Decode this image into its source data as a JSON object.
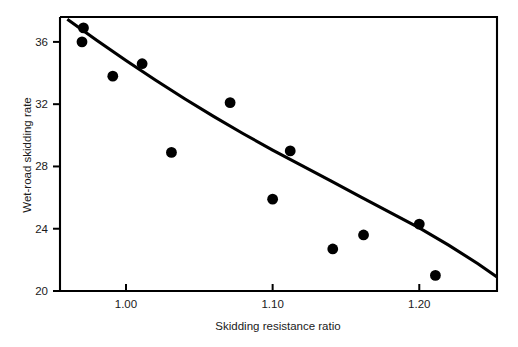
{
  "chart_data": {
    "type": "scatter",
    "title": "",
    "xlabel": "Skidding resistance ratio",
    "ylabel": "Wet-road skidding rate",
    "xlim": [
      0.955,
      1.253
    ],
    "ylim": [
      20,
      37.6
    ],
    "grid": false,
    "legend": null,
    "xticks": [
      "1.00",
      "1.10",
      "1.20"
    ],
    "xtick_values": [
      1.0,
      1.1,
      1.2
    ],
    "yticks": [
      "36",
      "32",
      "28",
      "24",
      "20"
    ],
    "ytick_values": [
      36,
      32,
      28,
      24,
      20
    ],
    "points": [
      {
        "x": 0.971,
        "y": 36.9
      },
      {
        "x": 0.97,
        "y": 36.0
      },
      {
        "x": 0.991,
        "y": 33.8
      },
      {
        "x": 1.011,
        "y": 34.6
      },
      {
        "x": 1.031,
        "y": 28.9
      },
      {
        "x": 1.071,
        "y": 32.1
      },
      {
        "x": 1.1,
        "y": 25.9
      },
      {
        "x": 1.112,
        "y": 29.0
      },
      {
        "x": 1.141,
        "y": 22.7
      },
      {
        "x": 1.162,
        "y": 23.6
      },
      {
        "x": 1.2,
        "y": 24.3
      },
      {
        "x": 1.211,
        "y": 21.0
      }
    ],
    "fit_curve": {
      "name": "fitted-exponential-curve",
      "x": [
        0.96,
        0.98,
        1.0,
        1.02,
        1.04,
        1.06,
        1.08,
        1.1,
        1.12,
        1.14,
        1.16,
        1.18,
        1.2,
        1.22,
        1.24,
        1.253
      ],
      "y": [
        37.45,
        36.1,
        34.8,
        33.55,
        32.35,
        31.2,
        30.1,
        29.05,
        28.05,
        27.05,
        26.05,
        25.05,
        24.05,
        22.95,
        21.75,
        20.9
      ]
    }
  }
}
